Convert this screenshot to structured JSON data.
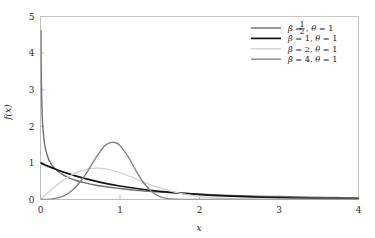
{
  "chart_data": {
    "type": "line",
    "title": "",
    "xlabel": "x",
    "ylabel": "f(x)",
    "xlim": [
      0,
      4
    ],
    "ylim": [
      0,
      5
    ],
    "xticks": [
      "0",
      "1",
      "2",
      "3",
      "4"
    ],
    "xtick_values": [
      0,
      1,
      2,
      3,
      4
    ],
    "yticks": [
      "0",
      "1",
      "2",
      "3",
      "4",
      "5"
    ],
    "ytick_values": [
      0,
      1,
      2,
      3,
      4,
      5
    ],
    "grid": false,
    "legend_position": "top-right",
    "series": [
      {
        "name": "beta_half",
        "legend": "β = ½,  θ = 1",
        "legend_beta_num": "1",
        "legend_beta_den": "2",
        "color": "#707070",
        "width": 1.4,
        "x": [
          0.005,
          0.01,
          0.02,
          0.03,
          0.05,
          0.07,
          0.1,
          0.13,
          0.17,
          0.22,
          0.28,
          0.35,
          0.45,
          0.55,
          0.7,
          0.85,
          1.0,
          1.2,
          1.45,
          1.7,
          2.0,
          2.3,
          2.6,
          3.0,
          3.4,
          3.7,
          4.0
        ],
        "y": [
          4.62,
          3.33,
          2.39,
          1.96,
          1.53,
          1.32,
          1.11,
          0.99,
          0.87,
          0.77,
          0.68,
          0.6,
          0.52,
          0.46,
          0.39,
          0.34,
          0.3,
          0.25,
          0.21,
          0.18,
          0.15,
          0.12,
          0.1,
          0.08,
          0.065,
          0.055,
          0.047
        ]
      },
      {
        "name": "beta_1",
        "legend": "β = 1,  θ = 1",
        "color": "#151515",
        "width": 1.7,
        "x": [
          0,
          0.1,
          0.2,
          0.3,
          0.45,
          0.6,
          0.8,
          1.0,
          1.25,
          1.5,
          1.8,
          2.1,
          2.4,
          2.8,
          3.2,
          3.6,
          4.0
        ],
        "y": [
          1.0,
          0.905,
          0.819,
          0.741,
          0.638,
          0.549,
          0.449,
          0.368,
          0.287,
          0.223,
          0.165,
          0.122,
          0.091,
          0.061,
          0.041,
          0.027,
          0.018
        ]
      },
      {
        "name": "beta_2",
        "legend": "β = 2,  θ = 1",
        "color": "#d2d2d2",
        "width": 1.4,
        "x": [
          0,
          0.1,
          0.2,
          0.3,
          0.4,
          0.5,
          0.6,
          0.707,
          0.8,
          0.9,
          1.0,
          1.15,
          1.3,
          1.5,
          1.7,
          1.9,
          2.1,
          2.4,
          2.7,
          3.0,
          3.4,
          3.7,
          4.0
        ],
        "y": [
          0.0,
          0.198,
          0.384,
          0.549,
          0.681,
          0.779,
          0.838,
          0.858,
          0.844,
          0.803,
          0.736,
          0.609,
          0.47,
          0.316,
          0.196,
          0.113,
          0.06,
          0.021,
          0.006,
          0.002,
          0.0004,
          0.0001,
          0.0
        ]
      },
      {
        "name": "beta_4",
        "legend": "β = 4,  θ = 1",
        "color": "#858585",
        "width": 1.4,
        "x": [
          0,
          0.15,
          0.3,
          0.4,
          0.5,
          0.6,
          0.7,
          0.8,
          0.88,
          0.95,
          1.0,
          1.1,
          1.2,
          1.3,
          1.4,
          1.5,
          1.6,
          1.7,
          1.85,
          2.0,
          2.2,
          2.5,
          3.0,
          3.5,
          4.0
        ],
        "y": [
          0.0,
          0.0135,
          0.107,
          0.253,
          0.484,
          0.797,
          1.152,
          1.45,
          1.552,
          1.551,
          1.472,
          1.177,
          0.795,
          0.452,
          0.212,
          0.08,
          0.024,
          0.0056,
          0.0005,
          3e-05,
          0.0,
          0.0,
          0.0,
          0.0,
          0.0
        ]
      }
    ]
  },
  "legend": {
    "entries": [
      {
        "label_prefix": "β = ",
        "frac_num": "1",
        "frac_den": "2",
        "label_suffix": ",  θ = 1"
      },
      {
        "label": "β = 1,  θ = 1"
      },
      {
        "label": "β = 2,  θ = 1"
      },
      {
        "label": "β = 4,  θ = 1"
      }
    ]
  },
  "axes": {
    "x_label": "x",
    "y_label": "f(x)"
  }
}
